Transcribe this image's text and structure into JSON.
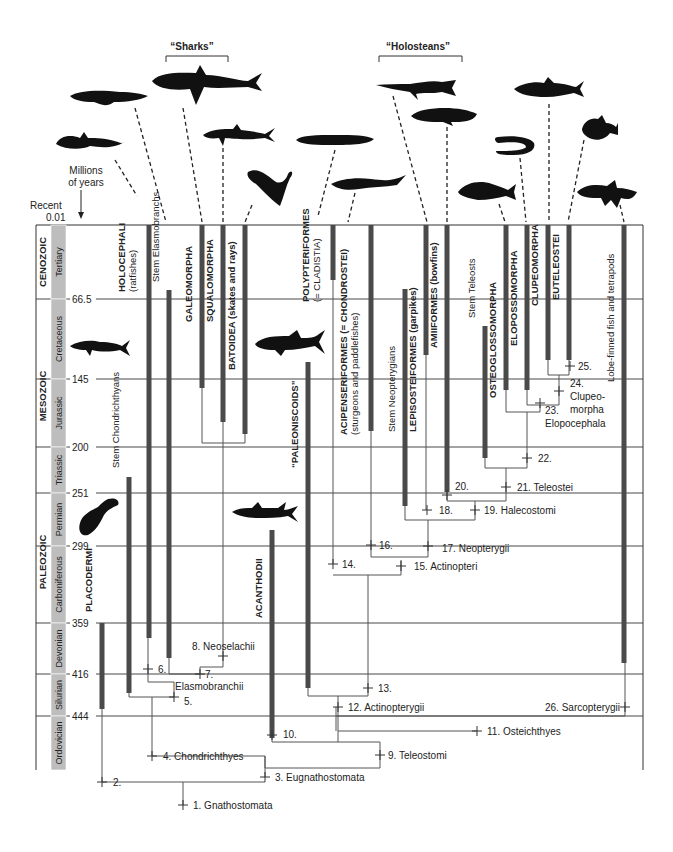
{
  "figure": {
    "group_labels": [
      {
        "label": "“Sharks”",
        "x": 192,
        "y": 50,
        "bracket": [
          166,
          228
        ]
      },
      {
        "label": "“Holosteans”",
        "x": 418,
        "y": 50,
        "bracket": [
          379,
          462
        ]
      }
    ],
    "axis": {
      "title_lines": [
        "Millions",
        "of years"
      ],
      "recent_label": "Recent",
      "recent_value": "0.01",
      "ticks": [
        {
          "label": "66.5",
          "y": 299
        },
        {
          "label": "145",
          "y": 379
        },
        {
          "label": "200",
          "y": 447
        },
        {
          "label": "251",
          "y": 493
        },
        {
          "label": "299",
          "y": 546
        },
        {
          "label": "359",
          "y": 623
        },
        {
          "label": "416",
          "y": 674
        },
        {
          "label": "444",
          "y": 716
        }
      ]
    },
    "eras": [
      {
        "label": "CENOZOIC",
        "y0": 225,
        "y1": 299
      },
      {
        "label": "MESOZOIC",
        "y0": 299,
        "y1": 493
      },
      {
        "label": "PALEOZOIC",
        "y0": 493,
        "y1": 771
      }
    ],
    "periods": [
      {
        "label": "Tertiary",
        "y0": 225,
        "y1": 299
      },
      {
        "label": "Cretaceous",
        "y0": 299,
        "y1": 379
      },
      {
        "label": "Jurassic",
        "y0": 379,
        "y1": 447
      },
      {
        "label": "Triassic",
        "y0": 447,
        "y1": 493
      },
      {
        "label": "Permian",
        "y0": 493,
        "y1": 546
      },
      {
        "label": "Carboniferous",
        "y0": 546,
        "y1": 623
      },
      {
        "label": "Devonian",
        "y0": 623,
        "y1": 674
      },
      {
        "label": "Silurian",
        "y0": 674,
        "y1": 716
      },
      {
        "label": "Ordovician",
        "y0": 716,
        "y1": 770
      }
    ],
    "taxa": [
      {
        "name": "PLACODERMI",
        "sub": "",
        "x": 102,
        "y0": 623,
        "y1": 709,
        "label_y": 612
      },
      {
        "name": "Stem Chondrichthyans",
        "sub": "",
        "x": 129,
        "y0": 477,
        "y1": 693,
        "label_y": 468,
        "normal": true
      },
      {
        "name": "HOLOCEPHALI",
        "sub": "(ratfishes)",
        "x": 149,
        "y0": 225,
        "y1": 638,
        "label_y": 292
      },
      {
        "name": "Stem Elasmobranchs",
        "sub": "",
        "x": 169,
        "y0": 290,
        "y1": 658,
        "label_y": 282,
        "normal": true
      },
      {
        "name": "GALEOMORPHA",
        "sub": "",
        "x": 202,
        "y0": 225,
        "y1": 388,
        "label_y": 322
      },
      {
        "name": "SQUALOMORPHA",
        "sub": "",
        "x": 223,
        "y0": 225,
        "y1": 422,
        "label_y": 322
      },
      {
        "name": "BATOIDEA (skates and rays)",
        "sub": "",
        "x": 245,
        "y0": 225,
        "y1": 434,
        "label_y": 370
      },
      {
        "name": "ACANTHODII",
        "sub": "",
        "x": 272,
        "y0": 530,
        "y1": 738,
        "label_y": 618
      },
      {
        "name": "“PALEONISCOIDS”",
        "sub": "",
        "x": 308,
        "y0": 362,
        "y1": 688,
        "label_y": 468
      },
      {
        "name": "POLYPTERIFORMES",
        "sub": "(= CLADISTIA)",
        "x": 333,
        "y0": 225,
        "y1": 280,
        "label_y": 302
      },
      {
        "name": "ACIPENSERIFORMES (= CHONDROSTEI)",
        "sub": "(sturgeons and paddlefishes)",
        "x": 371,
        "y0": 225,
        "y1": 431,
        "label_y": 435
      },
      {
        "name": "Stem Neopterygians",
        "sub": "",
        "x": 405,
        "y0": 289,
        "y1": 506,
        "label_y": 432,
        "normal": true
      },
      {
        "name": "LEPISOSTEIFORMES (garpikes)",
        "sub": "",
        "x": 426,
        "y0": 225,
        "y1": 355,
        "label_y": 432
      },
      {
        "name": "AMIIFORMES (bowfins)",
        "sub": "",
        "x": 447,
        "y0": 225,
        "y1": 492,
        "label_y": 348
      },
      {
        "name": "Stem Teleosts",
        "sub": "",
        "x": 485,
        "y0": 326,
        "y1": 458,
        "label_y": 318,
        "normal": true
      },
      {
        "name": "OSTEOGLOSSOMORPHA",
        "sub": "",
        "x": 506,
        "y0": 225,
        "y1": 390,
        "label_y": 398
      },
      {
        "name": "ELOPOSSOMORPHA",
        "sub": "",
        "x": 527,
        "y0": 225,
        "y1": 390,
        "label_y": 346
      },
      {
        "name": "CLUPEOMORPHA",
        "sub": "",
        "x": 548,
        "y0": 225,
        "y1": 360,
        "label_y": 306
      },
      {
        "name": "EUTELEOSTEI",
        "sub": "",
        "x": 569,
        "y0": 225,
        "y1": 360,
        "label_y": 300
      },
      {
        "name": "Lobe-finned fish and tetrapods",
        "sub": "",
        "x": 624,
        "y0": 225,
        "y1": 663,
        "label_y": 382,
        "normal": true
      }
    ],
    "nodes": [
      {
        "label": "1. Gnathostomata",
        "x": 183,
        "y": 805,
        "tx": 193,
        "ty": 809
      },
      {
        "label": "2.",
        "x": 102,
        "y": 782,
        "tx": 113,
        "ty": 786
      },
      {
        "label": "3. Eugnathostomata",
        "x": 265,
        "y": 777,
        "tx": 275,
        "ty": 781
      },
      {
        "label": "4. Chondrichthyes",
        "x": 152,
        "y": 756,
        "tx": 163,
        "ty": 760
      },
      {
        "label": "5.",
        "x": 174,
        "y": 697,
        "tx": 184,
        "ty": 705
      },
      {
        "label": "Elasmobranchii",
        "x": null,
        "y": null,
        "tx": 175,
        "ty": 690
      },
      {
        "label": "6.",
        "x": 148,
        "y": 669,
        "tx": 158,
        "ty": 673
      },
      {
        "label": "7.",
        "x": 200,
        "y": 674,
        "tx": 205,
        "ty": 678
      },
      {
        "label": "8. Neoselachii",
        "x": 223,
        "y": 656,
        "tx": 192,
        "ty": 650
      },
      {
        "label": "9. Teleostomi",
        "x": 380,
        "y": 755,
        "tx": 388,
        "ty": 759
      },
      {
        "label": "10.",
        "x": 272,
        "y": 735,
        "tx": 283,
        "ty": 738
      },
      {
        "label": "11. Osteichthyes",
        "x": 477,
        "y": 731,
        "tx": 487,
        "ty": 735
      },
      {
        "label": "12. Actinopterygii",
        "x": 338,
        "y": 707,
        "tx": 348,
        "ty": 711
      },
      {
        "label": "13.",
        "x": 368,
        "y": 688,
        "tx": 378,
        "ty": 692
      },
      {
        "label": "14.",
        "x": 333,
        "y": 564,
        "tx": 342,
        "ty": 568
      },
      {
        "label": "15. Actinopteri",
        "x": 401,
        "y": 566,
        "tx": 414,
        "ty": 570
      },
      {
        "label": "16.",
        "x": 371,
        "y": 545,
        "tx": 379,
        "ty": 549
      },
      {
        "label": "17. Neopterygii",
        "x": 428,
        "y": 546,
        "tx": 442,
        "ty": 552
      },
      {
        "label": "18.",
        "x": 427,
        "y": 510,
        "tx": 439,
        "ty": 514
      },
      {
        "label": "19. Halecostomi",
        "x": 475,
        "y": 510,
        "tx": 484,
        "ty": 514
      },
      {
        "label": "20.",
        "x": 447,
        "y": 495,
        "tx": 455,
        "ty": 490
      },
      {
        "label": "21. Teleostei",
        "x": 506,
        "y": 487,
        "tx": 517,
        "ty": 491
      },
      {
        "label": "22.",
        "x": 527,
        "y": 458,
        "tx": 538,
        "ty": 462
      },
      {
        "label": "23.",
        "x": 540,
        "y": 403,
        "tx": 545,
        "ty": 414
      },
      {
        "label": "Elopocephala",
        "x": null,
        "y": null,
        "tx": 545,
        "ty": 427
      },
      {
        "label": "24.",
        "x": 559,
        "y": 391,
        "tx": 570,
        "ty": 387
      },
      {
        "label": "Clupeo-",
        "x": null,
        "y": null,
        "tx": 570,
        "ty": 400
      },
      {
        "label": "morpha",
        "x": null,
        "y": null,
        "tx": 570,
        "ty": 413
      },
      {
        "label": "25.",
        "x": 570,
        "y": 366,
        "tx": 578,
        "ty": 370
      },
      {
        "label": "26. Sarcopterygii",
        "x": 625,
        "y": 707,
        "tx": 545,
        "ty": 711
      }
    ],
    "silhouettes": [
      {
        "name": "ratfish-silhouette",
        "x": 56,
        "y": 130,
        "w": 68,
        "h": 26
      },
      {
        "name": "stem-elasmobranch-silhouette",
        "x": 70,
        "y": 88,
        "w": 78,
        "h": 20
      },
      {
        "name": "galeomorph-shark-silhouette",
        "x": 152,
        "y": 65,
        "w": 110,
        "h": 40
      },
      {
        "name": "squalomorph-shark-silhouette",
        "x": 203,
        "y": 124,
        "w": 72,
        "h": 22
      },
      {
        "name": "ray-silhouette",
        "x": 246,
        "y": 162,
        "w": 48,
        "h": 48
      },
      {
        "name": "bichir-silhouette",
        "x": 296,
        "y": 133,
        "w": 78,
        "h": 14
      },
      {
        "name": "sturgeon-silhouette",
        "x": 331,
        "y": 175,
        "w": 75,
        "h": 16
      },
      {
        "name": "gar-silhouette",
        "x": 376,
        "y": 78,
        "w": 80,
        "h": 20
      },
      {
        "name": "bowfin-silhouette",
        "x": 411,
        "y": 106,
        "w": 66,
        "h": 20
      },
      {
        "name": "stem-teleost-silhouette",
        "x": 458,
        "y": 180,
        "w": 58,
        "h": 20
      },
      {
        "name": "eel-silhouette",
        "x": 494,
        "y": 135,
        "w": 40,
        "h": 20
      },
      {
        "name": "herring-silhouette",
        "x": 514,
        "y": 77,
        "w": 70,
        "h": 24
      },
      {
        "name": "euteleost-silhouette",
        "x": 580,
        "y": 115,
        "w": 38,
        "h": 26
      },
      {
        "name": "coelacanth-silhouette",
        "x": 577,
        "y": 180,
        "w": 60,
        "h": 30
      },
      {
        "name": "cretaceous-shark-silhouette",
        "x": 70,
        "y": 338,
        "w": 60,
        "h": 20
      },
      {
        "name": "paleoniscoid-silhouette",
        "x": 255,
        "y": 330,
        "w": 70,
        "h": 26
      },
      {
        "name": "placoderm-silhouette",
        "x": 78,
        "y": 497,
        "w": 42,
        "h": 40
      },
      {
        "name": "acanthodian-silhouette",
        "x": 232,
        "y": 502,
        "w": 66,
        "h": 22
      }
    ]
  }
}
